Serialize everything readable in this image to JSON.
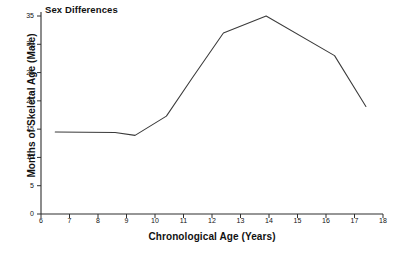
{
  "chart_data": {
    "type": "line",
    "title": "Sex Differences",
    "xlabel": "Chronological Age (Years)",
    "ylabel": "Months of Skeletal Age (Male)",
    "xlim": [
      6,
      18
    ],
    "ylim": [
      0,
      35
    ],
    "xticks": [
      6,
      7,
      8,
      9,
      10,
      11,
      12,
      13,
      14,
      15,
      16,
      17,
      18
    ],
    "yticks": [
      0,
      5,
      10,
      15,
      20,
      25,
      30,
      35
    ],
    "xtick_labels": [
      "6",
      "7",
      "8",
      "9",
      "10",
      "11",
      "12",
      "13",
      "14",
      "15",
      "16",
      "17",
      "18"
    ],
    "ytick_labels": [
      "0",
      "5",
      "10",
      "15",
      "20",
      "25",
      "30",
      "35"
    ],
    "grid": false,
    "legend": null,
    "series": [
      {
        "name": "Months of Skeletal Age (Male)",
        "color": "#3a3a3a",
        "x": [
          6.5,
          8.6,
          9.3,
          10.4,
          11.3,
          12.4,
          13.9,
          16.3,
          17.4
        ],
        "y": [
          14.5,
          14.4,
          13.9,
          17.3,
          24.0,
          32.0,
          35.0,
          28.0,
          19.0
        ]
      }
    ],
    "points_note": "single polyline, no markers"
  },
  "axes": {
    "axis_color": "#2e2e2e",
    "line_color": "#3a3a3a"
  }
}
